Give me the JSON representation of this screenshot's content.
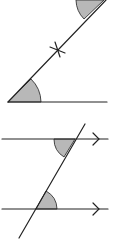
{
  "diagram": {
    "panels": [
      {
        "name": "corresponding-angles-transversal",
        "description": "Two angles shaded where a transversal with a crossing mark meets a horizontal line",
        "shaded_angles": 2,
        "marks": [
          "cross-mark"
        ]
      },
      {
        "name": "alternate-angles-parallel-lines",
        "description": "Two parallel lines with arrows cut by a transversal; alternate angles shaded",
        "parallel_lines": 2,
        "shaded_angles": 2
      }
    ],
    "colors": {
      "line": "#222222",
      "shade": "#b8b8b8",
      "background": "#ffffff"
    }
  }
}
